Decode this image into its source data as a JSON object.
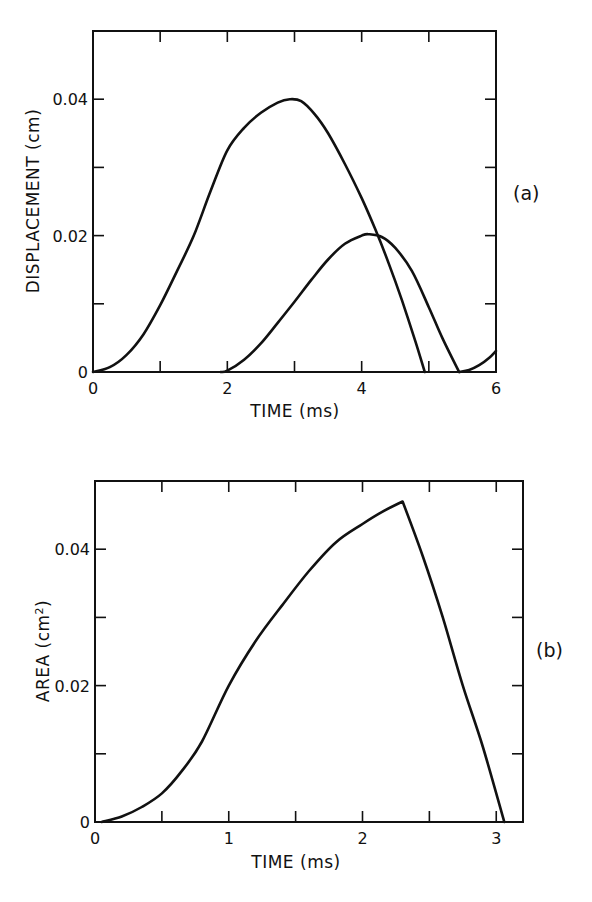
{
  "chart_data": [
    {
      "id": "a",
      "type": "line",
      "panel_label": "(a)",
      "title": "",
      "xlabel": "TIME (ms)",
      "ylabel": "DISPLACEMENT (cm)",
      "xlim": [
        0,
        6
      ],
      "ylim": [
        0,
        0.05
      ],
      "x_ticks": [
        0,
        1,
        2,
        3,
        4,
        5,
        6
      ],
      "x_tick_labels": [
        "0",
        "",
        "2",
        "",
        "4",
        "",
        "6"
      ],
      "y_ticks": [
        0,
        0.01,
        0.02,
        0.03,
        0.04,
        0.05
      ],
      "y_tick_labels": [
        "0",
        "",
        "0.02",
        "",
        "0.04",
        ""
      ],
      "grid": false,
      "legend": null,
      "series": [
        {
          "name": "curve-1",
          "x": [
            0,
            0.25,
            0.5,
            0.75,
            1.0,
            1.25,
            1.5,
            1.75,
            2.0,
            2.25,
            2.5,
            2.75,
            2.93,
            3.1,
            3.3,
            3.5,
            3.75,
            4.0,
            4.2,
            4.4,
            4.6,
            4.8,
            4.94
          ],
          "y": [
            0,
            0.0007,
            0.0025,
            0.0055,
            0.0098,
            0.0148,
            0.02,
            0.0265,
            0.0325,
            0.0358,
            0.038,
            0.0395,
            0.04,
            0.0397,
            0.0378,
            0.035,
            0.0305,
            0.0255,
            0.021,
            0.016,
            0.0105,
            0.0045,
            0
          ]
        },
        {
          "name": "curve-2",
          "x": [
            1.9,
            2.0,
            2.25,
            2.5,
            2.75,
            3.0,
            3.25,
            3.5,
            3.75,
            4.0,
            4.1,
            4.3,
            4.5,
            4.75,
            5.0,
            5.2,
            5.45
          ],
          "y": [
            0,
            0.0002,
            0.0018,
            0.0042,
            0.0072,
            0.0103,
            0.0135,
            0.0165,
            0.0188,
            0.02,
            0.0202,
            0.0198,
            0.0182,
            0.0148,
            0.0095,
            0.005,
            0
          ]
        },
        {
          "name": "curve-3",
          "x": [
            5.45,
            5.6,
            5.75,
            5.9,
            6.0
          ],
          "y": [
            0,
            0.0003,
            0.001,
            0.0021,
            0.0031
          ]
        }
      ]
    },
    {
      "id": "b",
      "type": "line",
      "panel_label": "(b)",
      "title": "",
      "xlabel": "TIME (ms)",
      "ylabel": "AREA (cm2)",
      "ylabel_base": "AREA  (cm",
      "ylabel_superscript": "2",
      "ylabel_suffix": ")",
      "xlim": [
        0,
        3.2
      ],
      "ylim": [
        0,
        0.05
      ],
      "x_ticks": [
        0,
        0.5,
        1,
        1.5,
        2,
        2.5,
        3
      ],
      "x_tick_labels": [
        "0",
        "",
        "1",
        "",
        "2",
        "",
        "3"
      ],
      "y_ticks": [
        0,
        0.01,
        0.02,
        0.03,
        0.04,
        0.05
      ],
      "y_tick_labels": [
        "0",
        "",
        "0.02",
        "",
        "0.04",
        ""
      ],
      "grid": false,
      "legend": null,
      "series": [
        {
          "name": "area",
          "x": [
            0.05,
            0.2,
            0.35,
            0.5,
            0.65,
            0.8,
            1.0,
            1.2,
            1.4,
            1.6,
            1.8,
            2.0,
            2.15,
            2.3,
            2.45,
            2.6,
            2.75,
            2.9,
            3.06
          ],
          "y": [
            0,
            0.0008,
            0.0022,
            0.0042,
            0.0075,
            0.0118,
            0.02,
            0.0265,
            0.0318,
            0.0368,
            0.041,
            0.0437,
            0.0455,
            0.047,
            0.039,
            0.03,
            0.02,
            0.011,
            0
          ]
        }
      ]
    }
  ]
}
